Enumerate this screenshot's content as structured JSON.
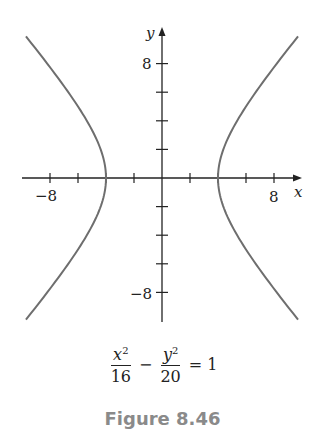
{
  "chart_data": {
    "type": "line",
    "title": "",
    "equation": "x^2/16 - y^2/20 = 1",
    "xlabel": "x",
    "ylabel": "y",
    "xlim": [
      -10,
      10
    ],
    "ylim": [
      -10,
      10
    ],
    "grid": false,
    "x_ticks": [
      -8,
      -6,
      -4,
      -2,
      2,
      4,
      6,
      8
    ],
    "y_ticks": [
      -8,
      -6,
      -4,
      -2,
      2,
      4,
      6,
      8
    ],
    "x_tick_labels": [
      {
        "value": -8,
        "label": "−8"
      },
      {
        "value": 8,
        "label": "8"
      }
    ],
    "y_tick_labels": [
      {
        "value": 8,
        "label": "8"
      },
      {
        "value": -8,
        "label": "−8"
      }
    ],
    "series": [
      {
        "name": "right branch",
        "a": 4,
        "b2": 20,
        "vertex": [
          4,
          0
        ],
        "points": [
          [
            9.7,
            9.88
          ],
          [
            6,
            5
          ],
          [
            4,
            0
          ],
          [
            6,
            -5
          ],
          [
            9.7,
            -9.88
          ]
        ]
      },
      {
        "name": "left branch",
        "a": 4,
        "b2": 20,
        "vertex": [
          -4,
          0
        ],
        "points": [
          [
            -9.7,
            9.88
          ],
          [
            -6,
            5
          ],
          [
            -4,
            0
          ],
          [
            -6,
            -5
          ],
          [
            -9.7,
            -9.88
          ]
        ]
      }
    ],
    "curve_color": "#6e6e6e"
  },
  "equation": {
    "term1_num": "x",
    "term1_exp": "2",
    "term1_den": "16",
    "minus": "−",
    "term2_num": "y",
    "term2_exp": "2",
    "term2_den": "20",
    "equals": "=",
    "rhs": "1"
  },
  "caption": "Figure 8.46"
}
